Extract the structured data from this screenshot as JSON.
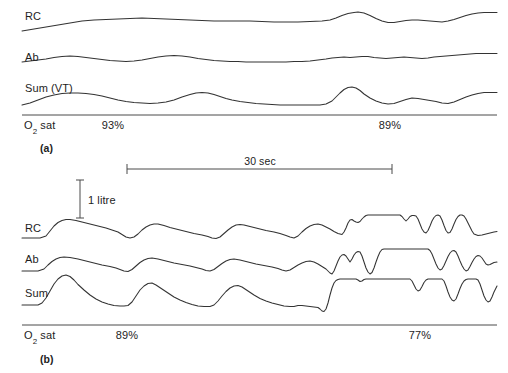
{
  "figure": {
    "type": "physiological-recording",
    "panels": [
      {
        "tag": "(a)",
        "tag_x": 40,
        "tag_y": 142,
        "axis": {
          "y": 115,
          "x_start": 22,
          "x_end": 497
        },
        "axis_label": "O",
        "axis_label_sub": "2",
        "axis_label_rest": " sat",
        "axis_label_x": 24,
        "axis_label_y": 119,
        "channels": [
          {
            "name": "RC",
            "label": "RC",
            "label_x": 25,
            "label_y": 10
          },
          {
            "name": "Ab",
            "label": "Ab",
            "label_x": 25,
            "label_y": 51
          },
          {
            "name": "Sum (VT)",
            "label": "Sum (VT)",
            "label_x": 25,
            "label_y": 82
          }
        ],
        "sat_markers": [
          {
            "value": "93%",
            "x": 113,
            "y": 119
          },
          {
            "value": "89%",
            "x": 390,
            "y": 119
          }
        ]
      },
      {
        "tag": "(b)",
        "tag_x": 40,
        "tag_y": 353,
        "axis": {
          "y": 325,
          "x_start": 22,
          "x_end": 497
        },
        "axis_label": "O",
        "axis_label_sub": "2",
        "axis_label_rest": " sat",
        "axis_label_x": 24,
        "axis_label_y": 329,
        "channels": [
          {
            "name": "RC",
            "label": "RC",
            "label_x": 25,
            "label_y": 222
          },
          {
            "name": "Ab",
            "label": "Ab",
            "label_x": 25,
            "label_y": 253
          },
          {
            "name": "Sum",
            "label": "Sum",
            "label_x": 25,
            "label_y": 287
          }
        ],
        "sat_markers": [
          {
            "value": "89%",
            "x": 127,
            "y": 329
          },
          {
            "value": "77%",
            "x": 420,
            "y": 329
          }
        ]
      }
    ],
    "time_scale": {
      "label": "30 sec",
      "label_x": 260,
      "label_y": 155,
      "bar_y": 169,
      "x_start": 127,
      "x_end": 392,
      "tick_half_height": 5
    },
    "amplitude_scale": {
      "label": "1 litre",
      "label_x": 88,
      "label_y": 194,
      "bar_x": 80,
      "y_top": 180,
      "y_bottom": 218,
      "tick_half_width": 4
    },
    "colors": {
      "trace": "#333333",
      "axis": "#4a4a4a",
      "text": "#1d1d1d",
      "background": "#ffffff"
    }
  },
  "chart_data": {
    "type": "line",
    "title": "",
    "xlabel": "Time",
    "ylabel": "Respiratory excursion (litres)",
    "grid": false,
    "legend": "inline-left-labels",
    "x_scale_note": "30 sec spans x=127 to x=392 px",
    "y_scale_note": "1 litre spans 38 px vertically",
    "annotations": [
      {
        "text": "93%",
        "panel": "(a)",
        "axis": "O2 sat"
      },
      {
        "text": "89%",
        "panel": "(a)",
        "axis": "O2 sat"
      },
      {
        "text": "89%",
        "panel": "(b)",
        "axis": "O2 sat"
      },
      {
        "text": "77%",
        "panel": "(b)",
        "axis": "O2 sat"
      },
      {
        "text": "30 sec",
        "role": "time-scale-bar"
      },
      {
        "text": "1 litre",
        "role": "amplitude-scale-bar"
      }
    ],
    "series": [
      {
        "name": "RC",
        "panel": "(a)",
        "points": "22,31 34,29 46,27 58,25 70,23 82,21 94,20 106,19.5 118,19 130,18.5 142,18 154,18.5 166,19 178,19.5 190,20 202,20.5 214,21 226,21 238,21 250,21 262,21.5 274,22 286,22 298,22 310,21.5 322,21 330,20 336,18 342,15.5 348,13.5 354,12.5 358,12 364,13 370,15.5 376,18.5 382,21 388,22.5 394,22.5 400,21.5 406,20.5 412,20 418,20 424,20.5 430,21 436,21.5 442,22 448,21 454,19.5 460,17.5 466,15.5 472,14 478,13 484,12.5 490,12.5 497,12.5"
      },
      {
        "name": "Ab",
        "panel": "(a)",
        "points": "22,62 30,61 38,60 46,59 54,57.5 62,56.5 70,56 78,56.5 86,57.5 94,58.5 102,59.5 110,60.5 118,61 126,61.5 134,61 142,60 150,58.5 158,57 166,56 174,55.5 182,56 190,57 198,58.5 206,59.5 214,60.5 222,61 230,61.5 238,61.5 246,62 254,62 262,62 270,62 278,62 286,62 294,61.5 302,61.5 310,61 318,60 326,59 332,58 338,57.5 344,57 350,57.5 356,57 362,56.5 368,56.5 374,57.5 380,58 386,58.5 392,58 398,57.5 404,57 410,57.5 416,58 422,58.5 428,58 434,57 440,56.5 446,56 452,55.5 458,55 464,54.5 470,54 476,53.5 482,53.5 488,53.5 494,53.5 497,53.5"
      },
      {
        "name": "Sum (VT)",
        "panel": "(a)",
        "points": "22,105 30,103 38,100 46,97 54,95 62,93.5 70,93 78,93 86,93.5 94,94.5 102,96 110,98 118,100 126,101.5 134,102.5 142,103 150,103.5 158,103 166,102 174,100 182,97 190,94.5 196,93 202,92.5 208,93 214,94.5 220,96.5 226,98.5 232,100 240,101.5 248,102.5 256,103.5 264,104 272,104.5 280,105 288,105 296,105 304,105 312,105 320,105 326,104 332,101 336,97 340,93 344,89.5 348,87.5 352,87 356,88 360,90.5 364,94 370,98 376,101 382,103 388,104 394,103.5 400,101.5 406,99.5 412,98 418,98.5 424,99.5 430,100.5 436,101.5 442,103 448,103.5 454,102 460,99.5 466,97 472,95 478,93.5 484,92.5 490,92.5 497,92.5"
      },
      {
        "name": "RC",
        "panel": "(b)",
        "points": "22,238 32,238 40,238 46,236 50,231 54,226 58,222.5 62,220.5 66,219.5 70,219.5 76,220.5 82,222 90,224 98,226 106,228 112,230 118,232 122,234.5 126,237 130,238 134,237 138,234 142,230 146,227 150,225 154,224 158,224 164,225.5 170,227.5 178,229.5 186,231.5 194,233.5 202,235 208,236.5 212,238 216,238.5 220,237 224,233.5 228,230 232,227 236,225 240,224.5 244,225 250,226.5 258,228.5 266,230.5 274,232 280,233.5 286,235.5 290,237 294,238 298,236 302,232 306,228.5 310,226 314,224.5 318,224 322,225 326,227 330,229 334,231.5 338,233.5 342,234.5 344,232 346,228 348,223 350,220 352,219.5 354,221 356,222 358,222.5 360,221.5 362,219 364,217 366,215.5 368,215 374,215 382,215 390,215 396,215 400,215 402,216.5 404,219 406,221 408,219 410,216.5 412,215.5 414,215.5 416,216 418,219 420,224 422,229 424,232 426,233 428,230.5 430,226 432,221 434,217.5 436,215.5 438,215 440,216 442,220 444,225.5 446,230.5 448,233 450,232.5 452,229 454,224 456,219.5 458,216.5 460,215 462,215 464,216 466,219 468,223 470,227 472,231 474,234 478,235.5 482,235 486,234 490,233 494,232 497,231.5"
      },
      {
        "name": "Ab",
        "panel": "(b)",
        "points": "22,271 30,271 38,271 44,269 48,265 52,261.5 56,259 60,257.5 64,257 70,257.5 78,259 86,261 94,263 102,265 110,266.5 116,268 120,269.5 124,271 128,271.5 132,269.5 136,266 140,262.5 144,260 148,258.5 152,258 158,259 166,261 174,263 182,264.5 190,266 196,267.5 202,269 206,270.5 210,271 214,269.5 218,266.5 222,263.5 226,261 230,259.5 234,259 240,260 248,262 256,264 264,265.5 272,267 278,268.5 282,270 286,271 290,270 294,267.5 298,265 302,263 306,261.5 310,261 314,262 318,264 322,266.5 326,269 328,271 330,273 332,274 334,271 336,266 338,261 340,257 342,255 344,254.5 346,256 348,259 350,262 352,259 354,255 356,252.5 358,251.5 360,252 362,256 364,262 366,268 368,272 370,274 372,272.5 374,268 376,262 378,256.5 380,252 382,249.5 384,249 392,249 400,249 410,249 418,249 424,249 428,249 430,250.5 432,254 434,259 436,264 438,268 440,270 442,269 444,265.5 446,261 448,256.5 450,253 452,251 454,250.5 456,252 458,256 460,261 462,265.5 464,269 466,271 468,270 470,266.5 472,262.5 474,259 476,256.5 478,255.5 480,256 482,258 484,261 486,264 488,265 490,264.5 492,263.5 494,262.5 497,262"
      },
      {
        "name": "Sum",
        "panel": "(b)",
        "points": "22,305 30,305 38,305 42,303 46,298 50,291 54,284 58,279 62,276 66,275 70,276.5 74,280 78,284.5 84,290 90,295 96,299 102,302 108,304 114,305.5 120,306 124,306 128,305.5 132,302 136,296 140,290 144,286 148,283.5 152,283 156,285 162,289 168,293 174,297 180,300 186,302.5 192,304.5 198,306 204,306.5 210,306.5 214,305 218,301 222,296 226,291.5 230,288 234,286 238,285.5 242,287 248,291 254,295 260,298.5 266,301 272,303 278,304.5 284,306 290,306.5 294,306.5 298,305.5 302,305.5 306,306 310,306.5 314,307 318,307.5 320,309 322,311 324,311.5 326,309 328,303 330,295 332,288 334,283 336,280.5 338,279.5 340,279 346,279 352,279 356,279 358,280 360,281.5 362,281 364,279.5 366,279 372,279 382,279 392,279 400,279 406,279 410,279 412,281 414,285 416,289 418,291 420,290 422,286.5 424,282.5 426,280 428,279 432,279 438,279 442,279 444,281 446,286 448,292 450,297 452,300 454,301 456,299 458,294 460,288.5 462,284 464,281 466,279.5 468,279 472,279 476,279 478,280 480,284 482,290 484,296 486,300 488,302 490,301 492,297 494,292 496,288 497,286"
      }
    ]
  }
}
